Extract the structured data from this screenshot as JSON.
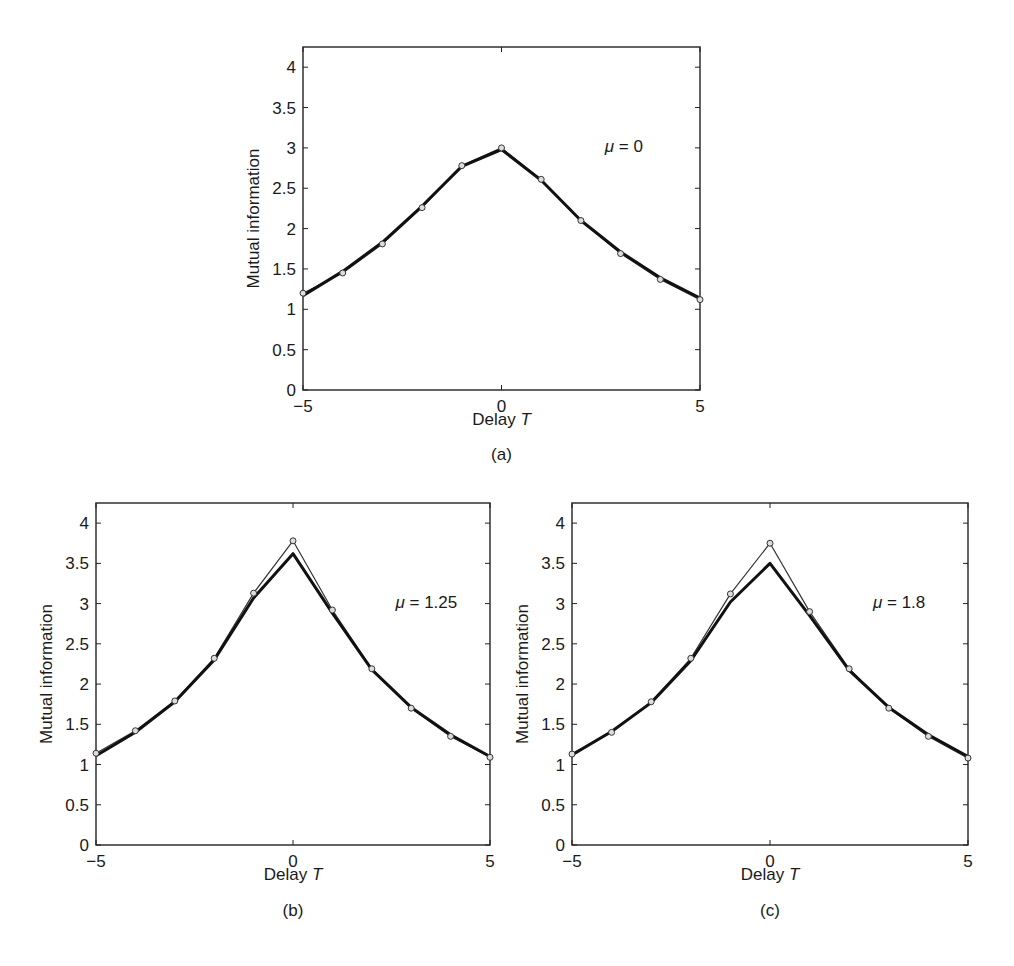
{
  "chart_data": [
    {
      "type": "line",
      "panel_label": "(a)",
      "annotation": "μ = 0",
      "xlabel": "Delay T",
      "ylabel": "Mutual information",
      "xlim": [
        -5,
        5
      ],
      "ylim": [
        0,
        4.25
      ],
      "xticks": [
        -5,
        0,
        5
      ],
      "yticks": [
        0,
        0.5,
        1,
        1.5,
        2,
        2.5,
        3,
        3.5,
        4
      ],
      "ytick_labels": [
        "0",
        "0.5",
        "1",
        "1.5",
        "2",
        "2.5",
        "3",
        "3.5",
        "4"
      ],
      "xtick_labels": [
        "−5",
        "0",
        "5"
      ],
      "grid": false,
      "x": [
        -5,
        -4,
        -3,
        -2,
        -1,
        0,
        1,
        2,
        3,
        4,
        5
      ],
      "series": [
        {
          "name": "thin line with circle markers",
          "style": "thin-markers",
          "values": [
            1.2,
            1.45,
            1.81,
            2.26,
            2.78,
            3.0,
            2.61,
            2.1,
            1.69,
            1.37,
            1.12
          ]
        },
        {
          "name": "thick line",
          "style": "thick",
          "values": [
            1.17,
            1.47,
            1.83,
            2.28,
            2.77,
            2.98,
            2.6,
            2.1,
            1.71,
            1.39,
            1.14
          ]
        }
      ]
    },
    {
      "type": "line",
      "panel_label": "(b)",
      "annotation": "μ = 1.25",
      "xlabel": "Delay T",
      "ylabel": "Mutual information",
      "xlim": [
        -5,
        5
      ],
      "ylim": [
        0,
        4.25
      ],
      "xticks": [
        -5,
        0,
        5
      ],
      "yticks": [
        0,
        0.5,
        1,
        1.5,
        2,
        2.5,
        3,
        3.5,
        4
      ],
      "ytick_labels": [
        "0",
        "0.5",
        "1",
        "1.5",
        "2",
        "2.5",
        "3",
        "3.5",
        "4"
      ],
      "xtick_labels": [
        "−5",
        "0",
        "5"
      ],
      "grid": false,
      "x": [
        -5,
        -4,
        -3,
        -2,
        -1,
        0,
        1,
        2,
        3,
        4,
        5
      ],
      "series": [
        {
          "name": "thin line with circle markers",
          "style": "thin-markers",
          "values": [
            1.14,
            1.42,
            1.79,
            2.32,
            3.13,
            3.78,
            2.92,
            2.19,
            1.7,
            1.35,
            1.09
          ]
        },
        {
          "name": "thick line",
          "style": "thick",
          "values": [
            1.11,
            1.4,
            1.78,
            2.3,
            3.07,
            3.62,
            2.88,
            2.18,
            1.71,
            1.37,
            1.1
          ]
        }
      ]
    },
    {
      "type": "line",
      "panel_label": "(c)",
      "annotation": "μ = 1.8",
      "xlabel": "Delay T",
      "ylabel": "Mutual information",
      "xlim": [
        -5,
        5
      ],
      "ylim": [
        0,
        4.25
      ],
      "xticks": [
        -5,
        0,
        5
      ],
      "yticks": [
        0,
        0.5,
        1,
        1.5,
        2,
        2.5,
        3,
        3.5,
        4
      ],
      "ytick_labels": [
        "0",
        "0.5",
        "1",
        "1.5",
        "2",
        "2.5",
        "3",
        "3.5",
        "4"
      ],
      "xtick_labels": [
        "−5",
        "0",
        "5"
      ],
      "grid": false,
      "x": [
        -5,
        -4,
        -3,
        -2,
        -1,
        0,
        1,
        2,
        3,
        4,
        5
      ],
      "series": [
        {
          "name": "thin line with circle markers",
          "style": "thin-markers",
          "values": [
            1.13,
            1.4,
            1.78,
            2.32,
            3.12,
            3.75,
            2.9,
            2.19,
            1.7,
            1.35,
            1.08
          ]
        },
        {
          "name": "thick line",
          "style": "thick",
          "values": [
            1.12,
            1.41,
            1.77,
            2.29,
            3.02,
            3.5,
            2.85,
            2.17,
            1.71,
            1.37,
            1.1
          ]
        }
      ]
    }
  ]
}
